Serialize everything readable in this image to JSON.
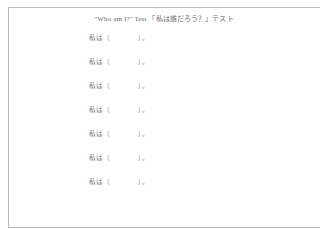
{
  "document": {
    "title": "\"Who am I?\" Test 「私は誰だろう？」テスト",
    "title_english": "\"Who am I?\" Test",
    "title_japanese": "「私は誰だろう？」テスト",
    "background_color": "#ffffff",
    "border_color": "#b9b9b9",
    "text_color": "#7a7a7a"
  },
  "answer_lines": [
    {
      "subject": "私は",
      "paren_open": "（",
      "blank": "",
      "paren_close": "）。"
    },
    {
      "subject": "私は",
      "paren_open": "（",
      "blank": "",
      "paren_close": "）。"
    },
    {
      "subject": "私は",
      "paren_open": "（",
      "blank": "",
      "paren_close": "）。"
    },
    {
      "subject": "私は",
      "paren_open": "（",
      "blank": "",
      "paren_close": "）。"
    },
    {
      "subject": "私は",
      "paren_open": "（",
      "blank": "",
      "paren_close": "）。"
    },
    {
      "subject": "私は",
      "paren_open": "（",
      "blank": "",
      "paren_close": "）。"
    },
    {
      "subject": "私は",
      "paren_open": "（",
      "blank": "",
      "paren_close": "）。"
    }
  ]
}
